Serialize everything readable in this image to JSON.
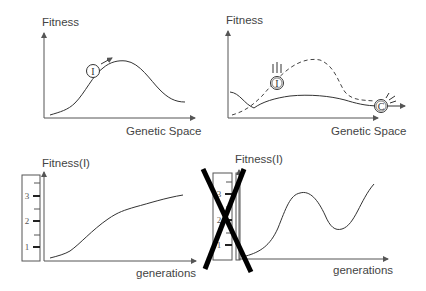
{
  "panels": {
    "top_left": {
      "ylabel": "Fitness",
      "xlabel": "Genetic Space",
      "marker": "I"
    },
    "top_right": {
      "ylabel": "Fitness",
      "xlabel": "Genetic Space",
      "marker_i": "I",
      "marker_c": "C"
    },
    "bottom_left": {
      "ylabel": "Fitness(I)",
      "xlabel": "generations",
      "scale_ticks": [
        "1",
        "2",
        "3"
      ]
    },
    "bottom_right": {
      "ylabel": "Fitness(I)",
      "xlabel": "generations",
      "scale_ticks": [
        "1",
        "2",
        "3"
      ],
      "crossed_out": true
    }
  },
  "colors": {
    "line": "#333333",
    "axis": "#555555",
    "cross": "#000000",
    "background": "#ffffff"
  }
}
